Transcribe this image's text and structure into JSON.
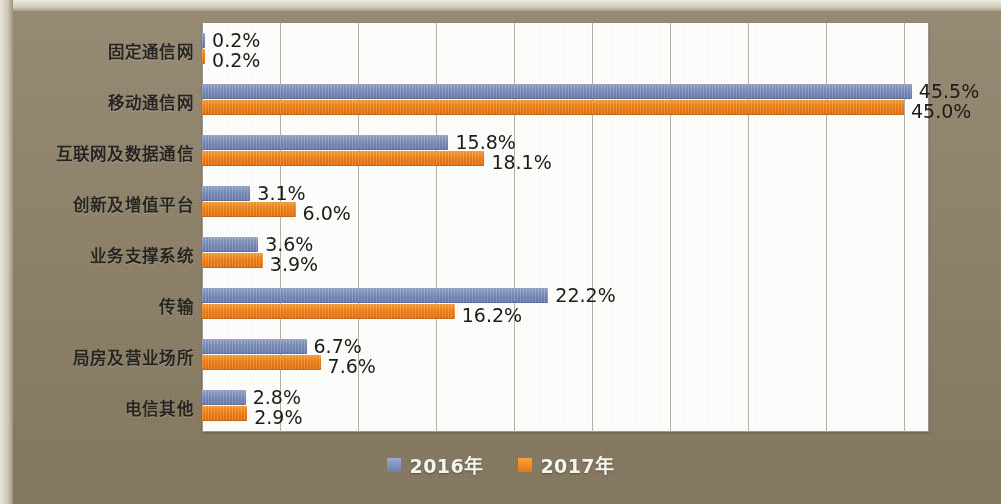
{
  "chart_data": {
    "type": "bar",
    "orientation": "horizontal",
    "title": "",
    "xlabel": "",
    "ylabel": "",
    "xlim": [
      0,
      46.6
    ],
    "grid": true,
    "gridline_interval": 5,
    "legend_position": "bottom-center",
    "categories": [
      "固定通信网",
      "移动通信网",
      "互联网及数据通信",
      "创新及增值平台",
      "业务支撑系统",
      "传输",
      "局房及营业场所",
      "电信其他"
    ],
    "series": [
      {
        "name": "2016年",
        "color": "#7e8fbd",
        "values": [
          0.2,
          45.5,
          15.8,
          3.1,
          3.6,
          22.2,
          6.7,
          2.8
        ],
        "labels": [
          "0.2%",
          "45.5%",
          "15.8%",
          "3.1%",
          "3.6%",
          "22.2%",
          "6.7%",
          "2.8%"
        ]
      },
      {
        "name": "2017年",
        "color": "#f3831a",
        "values": [
          0.2,
          45.0,
          18.1,
          6.0,
          3.9,
          16.2,
          7.6,
          2.9
        ],
        "labels": [
          "0.2%",
          "45.0%",
          "18.1%",
          "6.0%",
          "3.9%",
          "16.2%",
          "7.6%",
          "2.9%"
        ]
      }
    ]
  },
  "legend": {
    "items": [
      {
        "label": "2016年",
        "color": "#7e8fbd"
      },
      {
        "label": "2017年",
        "color": "#f3831a"
      }
    ]
  },
  "colors": {
    "series_2016": "#7e8fbd",
    "series_2017": "#f3831a",
    "background": "#8a7d64",
    "plot_background": "#fdfdfb",
    "gridline": "#b0aca3",
    "label_text": "#262420",
    "legend_text": "#f6f4ee"
  }
}
